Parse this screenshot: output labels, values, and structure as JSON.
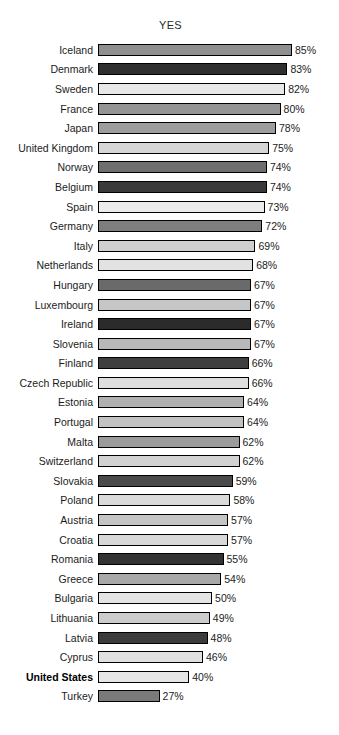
{
  "chart": {
    "title": "YES",
    "value_suffix": "%"
  },
  "chart_data": {
    "type": "bar",
    "orientation": "horizontal",
    "title": "YES",
    "xlabel": "",
    "ylabel": "",
    "xlim": [
      0,
      85
    ],
    "grid": false,
    "legend": false,
    "value_format": "{v}%",
    "highlight_category": "United States",
    "categories": [
      "Iceland",
      "Denmark",
      "Sweden",
      "France",
      "Japan",
      "United Kingdom",
      "Norway",
      "Belgium",
      "Spain",
      "Germany",
      "Italy",
      "Netherlands",
      "Hungary",
      "Luxembourg",
      "Ireland",
      "Slovenia",
      "Finland",
      "Czech Republic",
      "Estonia",
      "Portugal",
      "Malta",
      "Switzerland",
      "Slovakia",
      "Poland",
      "Austria",
      "Croatia",
      "Romania",
      "Greece",
      "Bulgaria",
      "Lithuania",
      "Latvia",
      "Cyprus",
      "United States",
      "Turkey"
    ],
    "values": [
      85,
      83,
      82,
      80,
      78,
      75,
      74,
      74,
      73,
      72,
      69,
      68,
      67,
      67,
      67,
      67,
      66,
      66,
      64,
      64,
      62,
      62,
      59,
      58,
      57,
      57,
      55,
      54,
      50,
      49,
      48,
      46,
      40,
      27
    ],
    "bar_colors": [
      "#8f8f8f",
      "#2f2f2f",
      "#e8e8e8",
      "#949494",
      "#9d9d9d",
      "#d6d6d6",
      "#6f6f6f",
      "#3a3a3a",
      "#ececec",
      "#7e7e7e",
      "#cfcfcf",
      "#e2e2e2",
      "#6a6a6a",
      "#c6c6c6",
      "#2b2b2b",
      "#b9b9b9",
      "#3f3f3f",
      "#dedede",
      "#b0b0b0",
      "#c2c2c2",
      "#9b9b9b",
      "#d2d2d2",
      "#4a4a4a",
      "#dadada",
      "#c4c4c4",
      "#d8d8d8",
      "#333333",
      "#a8a8a8",
      "#e4e4e4",
      "#cccccc",
      "#3c3c3c",
      "#e0e0e0",
      "#e6e6e6",
      "#7a7a7a"
    ],
    "rows": [
      {
        "label": "Iceland",
        "value": 85,
        "display": "85%",
        "color": "#8f8f8f"
      },
      {
        "label": "Denmark",
        "value": 83,
        "display": "83%",
        "color": "#2f2f2f"
      },
      {
        "label": "Sweden",
        "value": 82,
        "display": "82%",
        "color": "#e8e8e8"
      },
      {
        "label": "France",
        "value": 80,
        "display": "80%",
        "color": "#949494"
      },
      {
        "label": "Japan",
        "value": 78,
        "display": "78%",
        "color": "#9d9d9d"
      },
      {
        "label": "United Kingdom",
        "value": 75,
        "display": "75%",
        "color": "#d6d6d6"
      },
      {
        "label": "Norway",
        "value": 74,
        "display": "74%",
        "color": "#6f6f6f"
      },
      {
        "label": "Belgium",
        "value": 74,
        "display": "74%",
        "color": "#3a3a3a"
      },
      {
        "label": "Spain",
        "value": 73,
        "display": "73%",
        "color": "#ececec"
      },
      {
        "label": "Germany",
        "value": 72,
        "display": "72%",
        "color": "#7e7e7e"
      },
      {
        "label": "Italy",
        "value": 69,
        "display": "69%",
        "color": "#cfcfcf"
      },
      {
        "label": "Netherlands",
        "value": 68,
        "display": "68%",
        "color": "#e2e2e2"
      },
      {
        "label": "Hungary",
        "value": 67,
        "display": "67%",
        "color": "#6a6a6a"
      },
      {
        "label": "Luxembourg",
        "value": 67,
        "display": "67%",
        "color": "#c6c6c6"
      },
      {
        "label": "Ireland",
        "value": 67,
        "display": "67%",
        "color": "#2b2b2b"
      },
      {
        "label": "Slovenia",
        "value": 67,
        "display": "67%",
        "color": "#b9b9b9"
      },
      {
        "label": "Finland",
        "value": 66,
        "display": "66%",
        "color": "#3f3f3f"
      },
      {
        "label": "Czech Republic",
        "value": 66,
        "display": "66%",
        "color": "#dedede"
      },
      {
        "label": "Estonia",
        "value": 64,
        "display": "64%",
        "color": "#b0b0b0"
      },
      {
        "label": "Portugal",
        "value": 64,
        "display": "64%",
        "color": "#c2c2c2"
      },
      {
        "label": "Malta",
        "value": 62,
        "display": "62%",
        "color": "#9b9b9b"
      },
      {
        "label": "Switzerland",
        "value": 62,
        "display": "62%",
        "color": "#d2d2d2"
      },
      {
        "label": "Slovakia",
        "value": 59,
        "display": "59%",
        "color": "#4a4a4a"
      },
      {
        "label": "Poland",
        "value": 58,
        "display": "58%",
        "color": "#dadada"
      },
      {
        "label": "Austria",
        "value": 57,
        "display": "57%",
        "color": "#c4c4c4"
      },
      {
        "label": "Croatia",
        "value": 57,
        "display": "57%",
        "color": "#d8d8d8"
      },
      {
        "label": "Romania",
        "value": 55,
        "display": "55%",
        "color": "#333333"
      },
      {
        "label": "Greece",
        "value": 54,
        "display": "54%",
        "color": "#a8a8a8"
      },
      {
        "label": "Bulgaria",
        "value": 50,
        "display": "50%",
        "color": "#e4e4e4"
      },
      {
        "label": "Lithuania",
        "value": 49,
        "display": "49%",
        "color": "#cccccc"
      },
      {
        "label": "Latvia",
        "value": 48,
        "display": "48%",
        "color": "#3c3c3c"
      },
      {
        "label": "Cyprus",
        "value": 46,
        "display": "46%",
        "color": "#e0e0e0"
      },
      {
        "label": "United States",
        "value": 40,
        "display": "40%",
        "color": "#e6e6e6"
      },
      {
        "label": "Turkey",
        "value": 27,
        "display": "27%",
        "color": "#7a7a7a"
      }
    ]
  }
}
